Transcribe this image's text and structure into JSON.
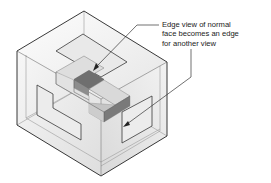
{
  "figure": {
    "colors": {
      "box_edge": "#2a2a2a",
      "glass_light": "#f4f4f4",
      "glass_dark": "#d8d8d8",
      "part_top": "#cfcfcf",
      "part_side": "#bdbdbd",
      "part_dark_face": "#6e6e6e",
      "projection_edge": "#3a3a3a",
      "leader": "#333333"
    }
  },
  "callout": {
    "lines": [
      "Edge view of normal",
      "face becomes an edge",
      "for another view"
    ]
  }
}
